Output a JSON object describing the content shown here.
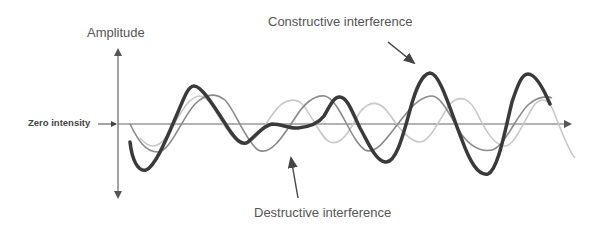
{
  "diagram": {
    "labels": {
      "y_axis": "Amplitude",
      "zero_line": "Zero intensity",
      "constructive": "Constructive interference",
      "destructive": "Destructive interference"
    },
    "series": [
      {
        "name": "wave-a",
        "style": "thin medium-gray",
        "color": "#8a8a8a"
      },
      {
        "name": "wave-b",
        "style": "thin light-gray",
        "color": "#c4c4c4"
      },
      {
        "name": "resultant-wave",
        "style": "thick dark",
        "color": "#3a3a3a"
      }
    ],
    "colors": {
      "axis": "#555555",
      "text": "#555555",
      "background": "#ffffff"
    }
  }
}
